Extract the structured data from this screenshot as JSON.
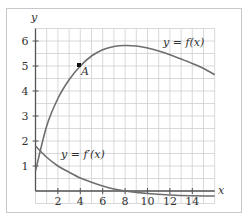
{
  "chart_data": {
    "type": "line",
    "title": "",
    "xlabel": "x",
    "ylabel": "y",
    "xlim": [
      0,
      16
    ],
    "ylim": [
      -0.5,
      6.5
    ],
    "grid": true,
    "x_ticks": [
      2,
      4,
      6,
      8,
      10,
      12,
      14
    ],
    "y_ticks": [
      1,
      2,
      3,
      4,
      5,
      6
    ],
    "x_tick_labels": [
      "2",
      "4",
      "6",
      "8",
      "10",
      "12",
      "14"
    ],
    "y_tick_labels": [
      "1",
      "2",
      "3",
      "4",
      "5",
      "6"
    ],
    "series": [
      {
        "name": "y = f(x)",
        "x": [
          0,
          1,
          2,
          3,
          4,
          5,
          6,
          7,
          8,
          9,
          10,
          11,
          12,
          13,
          14,
          15,
          16
        ],
        "values": [
          0.8,
          2.6,
          3.7,
          4.45,
          5.0,
          5.4,
          5.65,
          5.78,
          5.82,
          5.8,
          5.72,
          5.6,
          5.45,
          5.28,
          5.1,
          4.9,
          4.65
        ]
      },
      {
        "name": "y = f'(x)",
        "x": [
          0,
          1,
          2,
          3,
          4,
          5,
          6,
          7,
          8,
          10,
          12,
          14,
          16
        ],
        "values": [
          1.8,
          1.35,
          1.0,
          0.75,
          0.52,
          0.35,
          0.2,
          0.08,
          0.0,
          -0.1,
          -0.16,
          -0.19,
          -0.2
        ]
      }
    ],
    "annotations": [
      {
        "label": "A",
        "x": 4,
        "y": 5,
        "type": "point"
      },
      {
        "label": "y = f(x)",
        "x": 12.5,
        "y": 6.0
      },
      {
        "label": "y = f'(x)",
        "x": 4.5,
        "y": 1.4
      }
    ],
    "colors": {
      "curve": "#6e6e6e",
      "axis": "#555555",
      "grid": "#cfcfcf",
      "text": "#333333"
    }
  },
  "labels": {
    "x_axis": "x",
    "y_axis": "y",
    "f_label": "y = f(x)",
    "fprime_label": "y = f′(x)",
    "point_a": "A",
    "ticks_x": [
      "2",
      "4",
      "6",
      "8",
      "10",
      "12",
      "14"
    ],
    "ticks_y": [
      "1",
      "2",
      "3",
      "4",
      "5",
      "6"
    ]
  }
}
